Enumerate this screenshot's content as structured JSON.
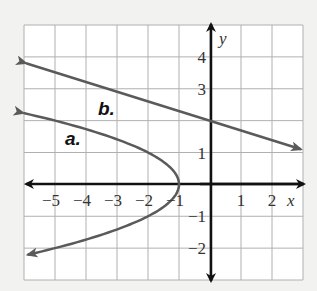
{
  "chart_data": {
    "type": "line",
    "title": "",
    "xlabel": "x",
    "ylabel": "y",
    "xlim": [
      -6,
      3
    ],
    "ylim": [
      -3,
      5
    ],
    "grid": true,
    "x_ticks": [
      "-5",
      "-4",
      "-3",
      "-2",
      "-1",
      "1",
      "2"
    ],
    "y_ticks": [
      "4",
      "3",
      "1",
      "-1",
      "-2"
    ],
    "series": [
      {
        "name": "a.",
        "kind": "parabola opening left",
        "equation_hint": "x = -y^2 - 1",
        "vertex": [
          -1,
          0
        ],
        "points": [
          [
            -6,
            2.24
          ],
          [
            -5,
            2
          ],
          [
            -2,
            1
          ],
          [
            -1,
            0
          ],
          [
            -2,
            -1
          ],
          [
            -5,
            -2
          ],
          [
            -6,
            -2.24
          ]
        ],
        "color": "#5a5a5a"
      },
      {
        "name": "b.",
        "kind": "line",
        "equation_hint": "y = -0.3x + 2",
        "points": [
          [
            -6,
            3.8
          ],
          [
            0,
            2
          ],
          [
            3,
            1.1
          ]
        ],
        "color": "#5a5a5a"
      }
    ],
    "labels": {
      "a": "a.",
      "b": "b."
    },
    "axis_color": "#111111",
    "grid_color": "#b0b0b0"
  }
}
